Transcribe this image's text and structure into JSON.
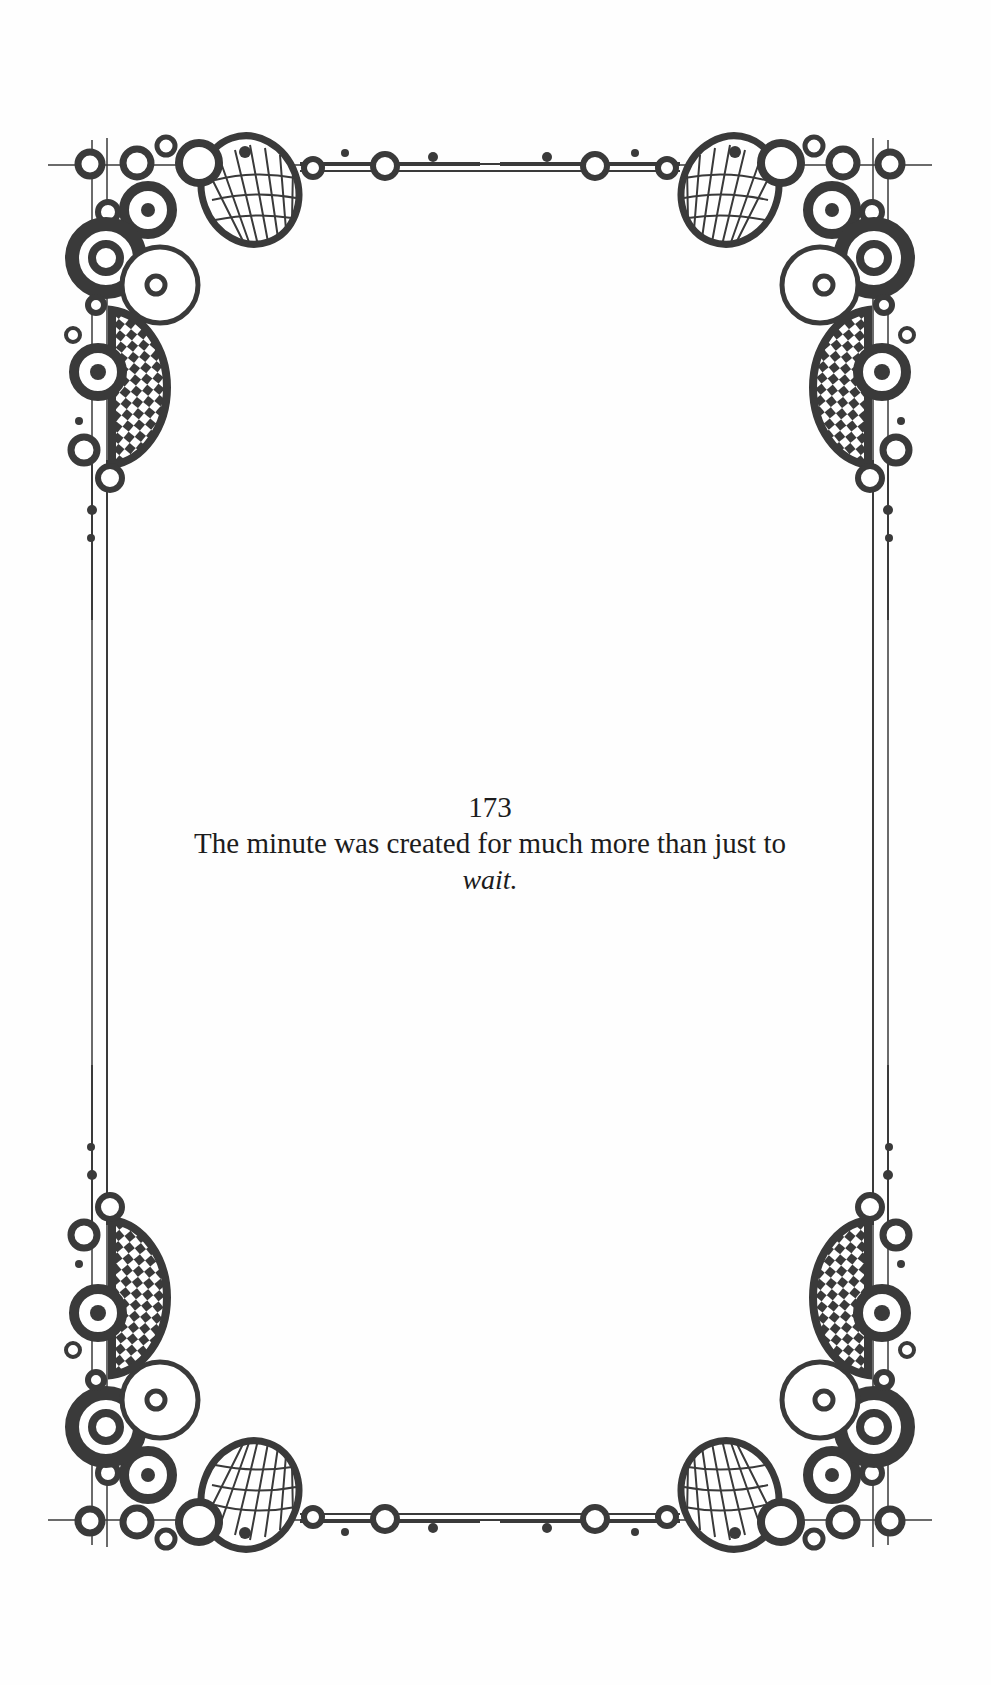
{
  "page": {
    "number": "173",
    "quote_line": "The minute was created for much more than just to",
    "quote_emphasis": "wait."
  },
  "decoration": {
    "border_style": "ornamental-frame",
    "corner_motif": [
      "concentric-circles",
      "checkerboard-disc",
      "scallop-shell",
      "ring-beads"
    ],
    "ink_color": "#3a3a3a",
    "background_color": "#fefefe"
  }
}
